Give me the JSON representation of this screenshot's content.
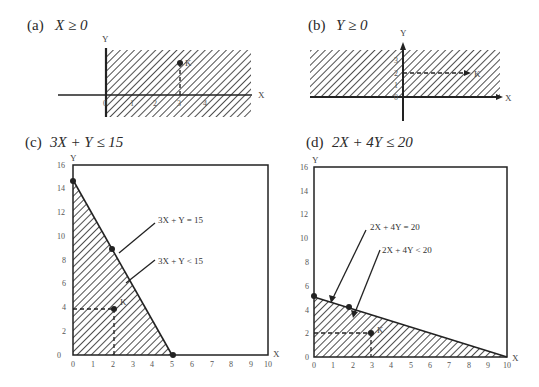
{
  "panels": {
    "a": {
      "tag": "(a)",
      "expr": "X ≥ 0",
      "x_label": "X",
      "y_label": "Y",
      "point": "K",
      "ticks": [
        "0",
        "1",
        "2",
        "3",
        "4"
      ]
    },
    "b": {
      "tag": "(b)",
      "expr": "Y ≥ 0",
      "x_label": "X",
      "y_label": "Y",
      "point": "K",
      "ticks": [
        "0",
        "1",
        "2",
        "3"
      ]
    },
    "c": {
      "tag": "(c)",
      "expr": "3X + Y ≤ 15",
      "x_label": "X",
      "y_label": "Y",
      "point": "K",
      "eq_label": "3X + Y = 15",
      "lt_label": "3X + Y < 15",
      "x_ticks": [
        "0",
        "1",
        "2",
        "3",
        "4",
        "5",
        "6",
        "7",
        "8",
        "9",
        "10"
      ],
      "y_ticks": [
        "0",
        "2",
        "4",
        "6",
        "8",
        "10",
        "12",
        "14",
        "16"
      ]
    },
    "d": {
      "tag": "(d)",
      "expr": "2X + 4Y ≤ 20",
      "x_label": "X",
      "y_label": "Y",
      "point": "K",
      "eq_label": "2X + 4Y = 20",
      "lt_label": "2X + 4Y < 20",
      "x_ticks": [
        "0",
        "1",
        "2",
        "3",
        "4",
        "5",
        "6",
        "7",
        "8",
        "9",
        "10"
      ],
      "y_ticks": [
        "0",
        "2",
        "4",
        "6",
        "8",
        "10",
        "12",
        "14",
        "16"
      ]
    }
  },
  "colors": {
    "ink": "#222222",
    "paper": "#ffffff"
  }
}
